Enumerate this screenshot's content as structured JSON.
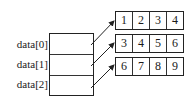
{
  "diagram": {
    "type": "2d-array-memory-layout",
    "labels": [
      "data[0]",
      "data[1]",
      "data[2]"
    ],
    "rows": [
      [
        "1",
        "2",
        "3",
        "4"
      ],
      [
        "3",
        "4",
        "5",
        "6"
      ],
      [
        "6",
        "7",
        "8",
        "9"
      ]
    ],
    "colors": {
      "line": "#222222",
      "background": "#ffffff"
    }
  }
}
